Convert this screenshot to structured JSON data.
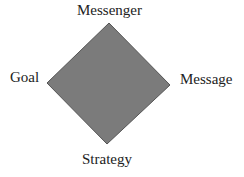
{
  "diagram": {
    "shape": "diamond",
    "fill_color": "#7b7b7b",
    "stroke_color": "#555555",
    "vertices": {
      "top": [
        109,
        23
      ],
      "right": [
        170,
        85
      ],
      "bottom": [
        107,
        144
      ],
      "left": [
        47,
        83
      ]
    },
    "labels": {
      "top": "Messenger",
      "left": "Goal",
      "right": "Message",
      "bottom": "Strategy"
    }
  }
}
